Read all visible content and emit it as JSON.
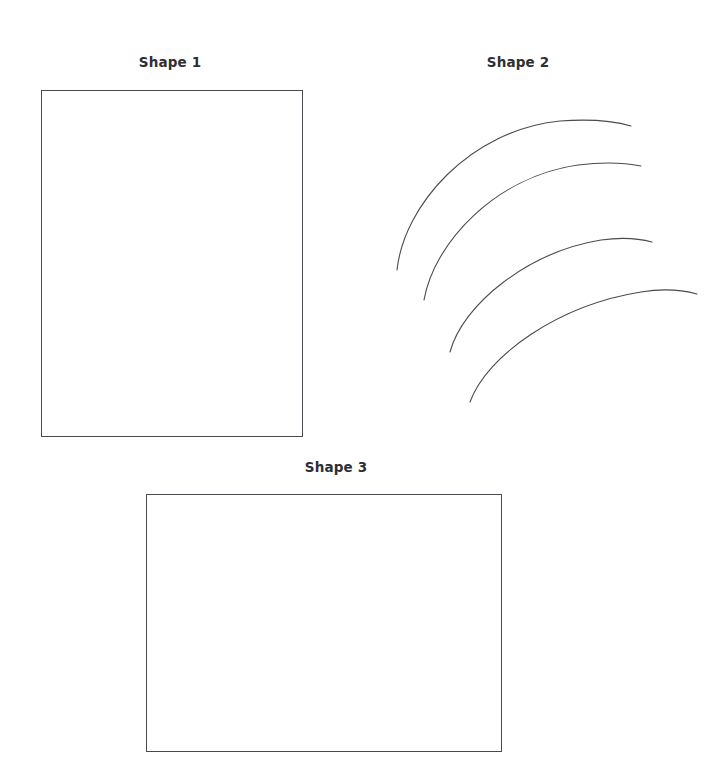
{
  "page": {
    "background_color": "#ffffff",
    "width": 725,
    "height": 760,
    "stroke_color": "#4a4a50",
    "text_color": "#2f2f33"
  },
  "shapes": [
    {
      "id": "shape-1",
      "label": "Shape 1",
      "kind": "rectangle",
      "geometry": {
        "x": 41,
        "y": 90,
        "width": 262,
        "height": 347
      },
      "label_position": {
        "center_x": 170,
        "top": 56
      }
    },
    {
      "id": "shape-2",
      "label": "Shape 2",
      "kind": "arcs",
      "arc_count": 4,
      "geometry": {
        "x": 380,
        "y": 100,
        "width": 330,
        "height": 320
      },
      "arcs": [
        {
          "index": 1,
          "start": [
            397,
            270
          ],
          "end": [
            631,
            126
          ],
          "apex": [
            571,
            122
          ]
        },
        {
          "index": 2,
          "start": [
            424,
            300
          ],
          "end": [
            641,
            166
          ],
          "apex": [
            588,
            165
          ]
        },
        {
          "index": 3,
          "start": [
            450,
            352
          ],
          "end": [
            652,
            242
          ],
          "apex": [
            610,
            240
          ]
        },
        {
          "index": 4,
          "start": [
            470,
            402
          ],
          "end": [
            697,
            294
          ],
          "apex": [
            652,
            292
          ]
        }
      ],
      "label_position": {
        "center_x": 518,
        "top": 56
      }
    },
    {
      "id": "shape-3",
      "label": "Shape 3",
      "kind": "rectangle",
      "geometry": {
        "x": 146,
        "y": 494,
        "width": 356,
        "height": 258
      },
      "label_position": {
        "center_x": 336,
        "top": 461
      }
    }
  ]
}
